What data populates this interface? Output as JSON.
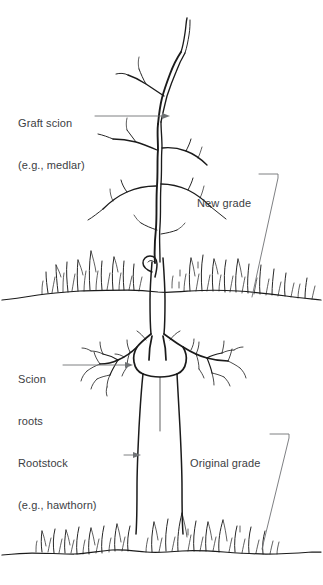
{
  "figure": {
    "kind": "botanical-line-drawing",
    "background_color": "#ffffff",
    "ink_color": "#1b1b1b",
    "leader_color": "#6f7275",
    "text_color": "#3c4043"
  },
  "labels": {
    "graft_scion": {
      "line1": "Graft scion",
      "line2": "(e.g., medlar)"
    },
    "new_grade": {
      "line1": "New grade"
    },
    "scion_roots": {
      "line1": "Scion",
      "line2": "roots"
    },
    "rootstock": {
      "line1": "Rootstock",
      "line2": "(e.g., hawthorn)"
    },
    "original_grade": {
      "line1": "Original grade"
    }
  }
}
